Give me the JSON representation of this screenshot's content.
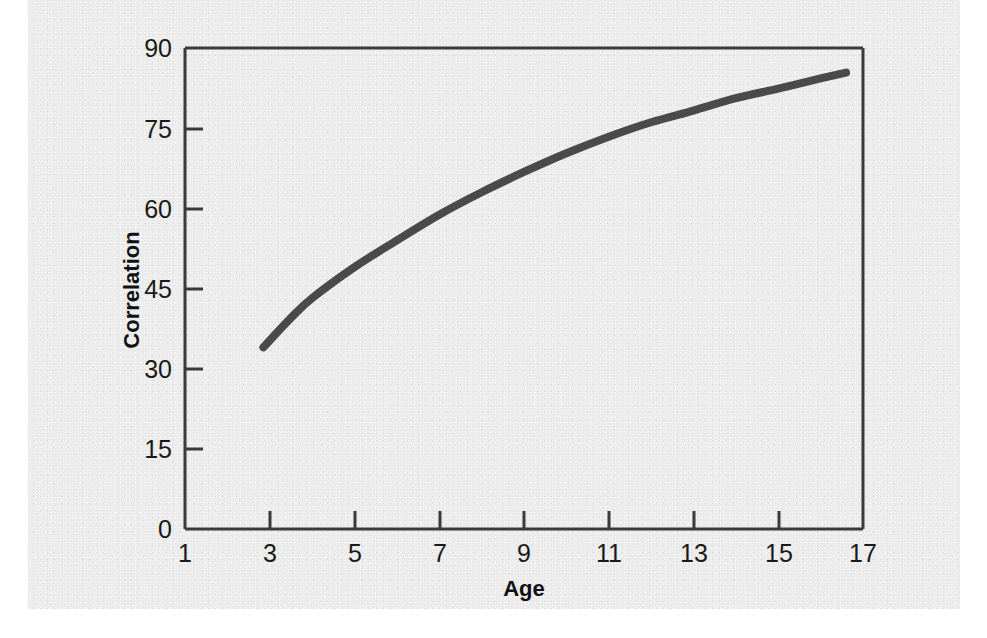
{
  "figure": {
    "background_color": "#ebebeb",
    "page_color": "#ffffff",
    "plot_border_color": "#3a3a3a"
  },
  "chart_data": {
    "type": "line",
    "title": "",
    "subtitle": "",
    "xlabel": "Age",
    "ylabel": "Correlation",
    "xlim": [
      1,
      17
    ],
    "ylim": [
      0,
      90
    ],
    "xticks": [
      1,
      3,
      5,
      7,
      9,
      11,
      13,
      15,
      17
    ],
    "xtick_labels": [
      "1",
      "3",
      "5",
      "7",
      "9",
      "11",
      "13",
      "15",
      "17"
    ],
    "yticks": [
      0,
      15,
      30,
      45,
      60,
      75,
      90
    ],
    "ytick_labels": [
      "0",
      "15",
      "30",
      "45",
      "60",
      "75",
      "90"
    ],
    "grid": false,
    "legend": false,
    "legend_position": "none",
    "line_color": "#4a4a4a",
    "line_width": 8,
    "series": [
      {
        "name": "Correlation by Age",
        "x": [
          2.85,
          3.5,
          4.0,
          5.0,
          6.0,
          7.0,
          8.0,
          9.0,
          10.0,
          11.0,
          12.0,
          13.0,
          14.0,
          15.0,
          16.0,
          16.6
        ],
        "values": [
          34,
          39.5,
          43.2,
          49,
          54,
          58.8,
          63,
          66.8,
          70.3,
          73.4,
          76.1,
          78.3,
          80.6,
          82.4,
          84.3,
          85.4
        ]
      }
    ],
    "annotations": []
  },
  "axis_titles": {
    "x": "Age",
    "y": "Correlation"
  }
}
